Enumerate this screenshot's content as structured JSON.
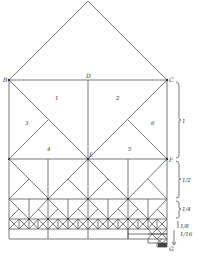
{
  "diagram": {
    "points": {
      "B": "B",
      "C": "C",
      "D": "D",
      "E": "E",
      "F": "F",
      "G": "G"
    },
    "regions": [
      "1",
      "2",
      "3",
      "4",
      "5",
      "6"
    ],
    "scale_labels": [
      "1",
      "1/2",
      "1/4",
      "1/8",
      "1/16"
    ]
  }
}
